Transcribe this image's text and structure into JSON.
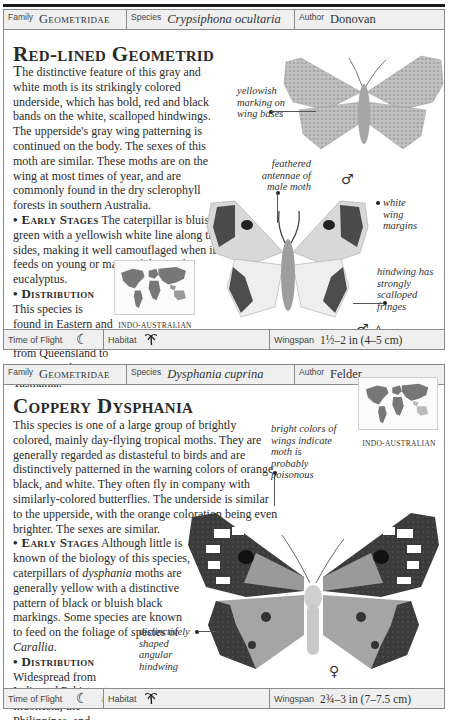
{
  "entries": [
    {
      "header": {
        "family_label": "Family",
        "family_value": "Geometridae",
        "species_label": "Species",
        "species_value": "Crypsiphona ocultaria",
        "author_label": "Author",
        "author_value": "Donovan"
      },
      "title": "Red-lined Geometrid",
      "body": {
        "lead": "T",
        "intro": "he distinctive feature of this gray and white moth is its strikingly colored underside, which has bold, red and black bands on the white, scalloped hindwings. The upperside's gray wing patterning is continued on the body. The sexes of this moth are similar. These moths are on the wing at most times of year, and are commonly found in the dry sclerophyll forests in southern Australia.",
        "early_stages_heading": "Early Stages",
        "early_stages_text": "The caterpillar is bluish green with a yellowish white line along the sides, making it well camouflaged when it feeds on young or mature foliage of eucalyptus.",
        "distribution_heading": "Distribution",
        "distribution_text": "This species is found in Eastern and southern Australia, from Queensland to Victoria and Tasmania."
      },
      "map_caption": "INDO-AUSTRALIAN",
      "annotations": [
        "yellowish marking on wing bases",
        "feathered antennae of male moth",
        "white wing margins",
        "hindwing has strongly scalloped fringes"
      ],
      "sex_symbols": [
        "♂",
        "♂ △"
      ],
      "footer": {
        "time_label": "Time of Flight",
        "time_icons": [
          "moon-icon"
        ],
        "moon_glyph": "☾",
        "habitat_label": "Habitat",
        "habitat_icon": "palm-tree-icon",
        "habitat_glyph": "🌴",
        "wingspan_label": "Wingspan",
        "wingspan_value": "1½–2 in (4–5 cm)"
      }
    },
    {
      "header": {
        "family_label": "Family",
        "family_value": "Geometridae",
        "species_label": "Species",
        "species_value": "Dysphania cuprina",
        "author_label": "Author",
        "author_value": "Felder"
      },
      "title": "Coppery Dysphania",
      "body": {
        "intro": "This species is one of a large group of brightly colored, mainly day-flying tropical moths. They are generally regarded as distasteful to birds and are distinctively patterned in the warning colors of orange, black, and white. They often fly in company with similarly-colored butterflies. The underside is similar to the upperside, with the orange coloration being even brighter. The sexes are similar.",
        "early_stages_heading": "Early Stages",
        "early_stages_text_a": "Although little is known of the biology of this species, caterpillars of ",
        "early_stages_italic_a": "dysphania",
        "early_stages_text_b": " moths are generally yellow with a distinctive pattern of black or bluish black markings. Some species are known to feed on the foliage of species of ",
        "early_stages_italic_b": "Carallia",
        "early_stages_text_c": ".",
        "distribution_heading": "Distribution",
        "distribution_text": "Widespread from India and Pakistan to Indonesia, the Philippines, and Papua New Guinea."
      },
      "map_caption": "INDO-AUSTRALIAN",
      "annotations": [
        "bright colors of wings indicate moth is probably poisonous",
        "distinctively shaped angular hindwing"
      ],
      "sex_symbols": [
        "♀"
      ],
      "footer": {
        "time_label": "Time of Flight",
        "time_icons": [
          "moon-icon",
          "sun-icon"
        ],
        "moon_glyph": "☾",
        "sun_glyph": "☼",
        "habitat_label": "Habitat",
        "habitat_icon": "palm-tree-icon",
        "habitat_glyph": "🌴",
        "wingspan_label": "Wingspan",
        "wingspan_value": "2¾–3 in (7–7.5 cm)"
      }
    }
  ]
}
